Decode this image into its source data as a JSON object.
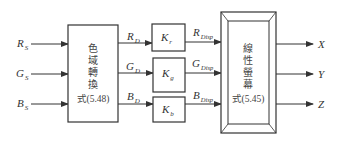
{
  "diagram": {
    "inputs": [
      {
        "main": "R",
        "sub": "S"
      },
      {
        "main": "G",
        "sub": "S"
      },
      {
        "main": "B",
        "sub": "S"
      }
    ],
    "gamut_block": {
      "chars": [
        "色",
        "域",
        "轉",
        "換"
      ],
      "equation": "式(5.48)"
    },
    "intermediate": [
      {
        "main": "R",
        "sub": "D"
      },
      {
        "main": "G",
        "sub": "D"
      },
      {
        "main": "B",
        "sub": "D"
      }
    ],
    "gains": [
      {
        "main": "K",
        "sub": "r"
      },
      {
        "main": "K",
        "sub": "g"
      },
      {
        "main": "K",
        "sub": "b"
      }
    ],
    "display": [
      {
        "main": "R",
        "sub": "Disp"
      },
      {
        "main": "G",
        "sub": "Disp"
      },
      {
        "main": "B",
        "sub": "Disp"
      }
    ],
    "screen_block": {
      "chars": [
        "線",
        "性",
        "螢",
        "幕"
      ],
      "equation": "式(5.45)"
    },
    "outputs": [
      {
        "main": "X"
      },
      {
        "main": "Y"
      },
      {
        "main": "Z"
      }
    ],
    "colors": {
      "line": "#333333",
      "text": "#444444",
      "background": "#ffffff"
    }
  }
}
